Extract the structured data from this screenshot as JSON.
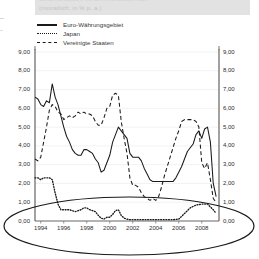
{
  "header": {
    "title": "Geldmarktsätze im Dreimonatsbereich",
    "subtitle": "(monatlich; in % p. a.)"
  },
  "legend": {
    "position": "top-left",
    "items": [
      {
        "label": "Euro-Währungsgebiet",
        "style": "solid",
        "key_icon": "solid-line-icon"
      },
      {
        "label": "Japan",
        "style": "dotted",
        "key_icon": "dotted-line-icon"
      },
      {
        "label": "Vereinigte Staaten",
        "style": "dashed",
        "key_icon": "dashed-line-icon"
      }
    ]
  },
  "annotation": {
    "shape": "ellipse",
    "name": "highlight-ellipse",
    "color": "#1a1a1a"
  },
  "axis_labels": {
    "y_left": [
      "9,00",
      "8,00",
      "7,00",
      "6,00",
      "5,00",
      "4,00",
      "3,00",
      "2,00",
      "1,00",
      "0,00"
    ],
    "y_right": [
      "9,00",
      "8,00",
      "7,00",
      "6,00",
      "5,00",
      "4,00",
      "3,00",
      "2,00",
      "1,00",
      "0,00"
    ],
    "x": [
      "1994",
      "1996",
      "1998",
      "2000",
      "2002",
      "2004",
      "2006",
      "2008"
    ]
  },
  "chart_data": {
    "type": "line",
    "title": "Geldmarktsätze im Dreimonatsbereich",
    "subtitle": "(monatlich; in % p. a.)",
    "xlabel": "",
    "ylabel": "% p. a.",
    "xlim": [
      1993.5,
      2009.5
    ],
    "ylim": [
      0,
      9
    ],
    "ytick_step": 1,
    "yticks": [
      0,
      1,
      2,
      3,
      4,
      5,
      6,
      7,
      8,
      9
    ],
    "xticks": [
      1994,
      1996,
      1998,
      2000,
      2002,
      2004,
      2006,
      2008
    ],
    "grid": "horizontal-faint",
    "legend_position": "above-plot-left",
    "series": [
      {
        "name": "Euro-Währungsgebiet",
        "style": "solid",
        "color": "#1a1a1a",
        "x": [
          1993.5,
          1993.75,
          1994.0,
          1994.25,
          1994.5,
          1994.75,
          1995.0,
          1995.25,
          1995.5,
          1995.75,
          1996.0,
          1996.25,
          1996.5,
          1996.75,
          1997.0,
          1997.25,
          1997.5,
          1997.75,
          1998.0,
          1998.25,
          1998.5,
          1998.75,
          1999.0,
          1999.25,
          1999.5,
          1999.75,
          2000.0,
          2000.25,
          2000.5,
          2000.75,
          2001.0,
          2001.25,
          2001.5,
          2001.75,
          2002.0,
          2002.25,
          2002.5,
          2002.75,
          2003.0,
          2003.25,
          2003.5,
          2003.75,
          2004.0,
          2004.25,
          2004.5,
          2004.75,
          2005.0,
          2005.25,
          2005.5,
          2005.75,
          2006.0,
          2006.25,
          2006.5,
          2006.75,
          2007.0,
          2007.25,
          2007.5,
          2007.75,
          2008.0,
          2008.25,
          2008.5,
          2008.75,
          2009.0,
          2009.25
        ],
        "y": [
          6.6,
          6.5,
          6.2,
          6.1,
          6.4,
          6.3,
          7.3,
          6.6,
          6.2,
          5.6,
          5.0,
          4.5,
          4.2,
          3.8,
          3.6,
          3.5,
          3.5,
          3.8,
          3.8,
          3.7,
          3.6,
          3.3,
          3.1,
          2.6,
          2.7,
          3.1,
          3.5,
          4.2,
          4.6,
          5.0,
          4.8,
          4.6,
          4.4,
          3.6,
          3.4,
          3.4,
          3.4,
          3.2,
          2.8,
          2.5,
          2.2,
          2.1,
          2.1,
          2.1,
          2.1,
          2.1,
          2.1,
          2.1,
          2.1,
          2.3,
          2.6,
          2.9,
          3.3,
          3.7,
          3.9,
          4.1,
          4.6,
          4.8,
          4.4,
          4.9,
          5.0,
          4.2,
          2.0,
          1.3
        ]
      },
      {
        "name": "Japan",
        "style": "dotted",
        "color": "#1a1a1a",
        "x": [
          1993.5,
          1993.75,
          1994.0,
          1994.25,
          1994.5,
          1994.75,
          1995.0,
          1995.25,
          1995.5,
          1995.75,
          1996.0,
          1996.25,
          1996.5,
          1996.75,
          1997.0,
          1997.25,
          1997.5,
          1997.75,
          1998.0,
          1998.25,
          1998.5,
          1998.75,
          1999.0,
          1999.25,
          1999.5,
          1999.75,
          2000.0,
          2000.25,
          2000.5,
          2000.75,
          2001.0,
          2001.25,
          2001.5,
          2001.75,
          2002.0,
          2002.5,
          2003.0,
          2003.5,
          2004.0,
          2004.5,
          2005.0,
          2005.5,
          2006.0,
          2006.5,
          2007.0,
          2007.5,
          2008.0,
          2008.5,
          2009.0,
          2009.25
        ],
        "y": [
          2.3,
          2.3,
          2.2,
          2.3,
          2.3,
          2.3,
          2.2,
          1.5,
          0.9,
          0.6,
          0.6,
          0.6,
          0.6,
          0.55,
          0.5,
          0.55,
          0.6,
          0.7,
          0.7,
          0.6,
          0.55,
          0.5,
          0.3,
          0.15,
          0.1,
          0.2,
          0.2,
          0.35,
          0.55,
          0.6,
          0.3,
          0.15,
          0.1,
          0.07,
          0.07,
          0.07,
          0.07,
          0.07,
          0.07,
          0.07,
          0.07,
          0.07,
          0.1,
          0.4,
          0.7,
          0.85,
          0.9,
          0.9,
          0.6,
          0.4
        ]
      },
      {
        "name": "Vereinigte Staaten",
        "style": "dashed",
        "color": "#1a1a1a",
        "x": [
          1993.5,
          1993.75,
          1994.0,
          1994.25,
          1994.5,
          1994.75,
          1995.0,
          1995.25,
          1995.5,
          1995.75,
          1996.0,
          1996.25,
          1996.5,
          1996.75,
          1997.0,
          1997.25,
          1997.5,
          1997.75,
          1998.0,
          1998.25,
          1998.5,
          1998.75,
          1999.0,
          1999.25,
          1999.5,
          1999.75,
          2000.0,
          2000.25,
          2000.5,
          2000.75,
          2001.0,
          2001.25,
          2001.5,
          2001.75,
          2002.0,
          2002.25,
          2002.5,
          2002.75,
          2003.0,
          2003.25,
          2003.5,
          2003.75,
          2004.0,
          2004.25,
          2004.5,
          2004.75,
          2005.0,
          2005.25,
          2005.5,
          2005.75,
          2006.0,
          2006.25,
          2006.5,
          2006.75,
          2007.0,
          2007.25,
          2007.5,
          2007.75,
          2008.0,
          2008.25,
          2008.5,
          2008.75,
          2009.0,
          2009.25
        ],
        "y": [
          3.3,
          3.2,
          3.4,
          4.2,
          5.0,
          5.9,
          6.2,
          6.1,
          5.8,
          5.7,
          5.4,
          5.5,
          5.6,
          5.5,
          5.6,
          5.8,
          5.7,
          5.8,
          5.7,
          5.7,
          5.6,
          5.3,
          5.1,
          5.1,
          5.5,
          6.0,
          6.1,
          6.7,
          6.8,
          6.7,
          5.3,
          4.4,
          3.6,
          2.3,
          1.9,
          1.9,
          1.8,
          1.5,
          1.3,
          1.2,
          1.1,
          1.2,
          1.1,
          1.3,
          1.8,
          2.4,
          2.9,
          3.4,
          3.9,
          4.4,
          4.8,
          5.3,
          5.4,
          5.4,
          5.4,
          5.4,
          5.3,
          5.0,
          3.1,
          2.8,
          3.1,
          2.2,
          1.2,
          1.0
        ]
      }
    ]
  }
}
